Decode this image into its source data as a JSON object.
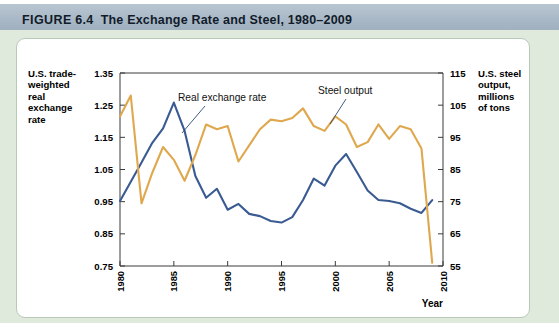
{
  "header": {
    "figure_word": "FIGURE",
    "figure_number": "6.4",
    "title": "The Exchange Rate and Steel, 1980–2009",
    "band_color": "#aab9c7"
  },
  "panel": {
    "background_color": "#dfeadd",
    "card_color": "#ffffff"
  },
  "chart_data": {
    "type": "line",
    "title": "The Exchange Rate and Steel, 1980–2009",
    "xlabel": "Year",
    "grid": false,
    "legend": "inline-annotations",
    "x": [
      1980,
      1981,
      1982,
      1983,
      1984,
      1985,
      1986,
      1987,
      1988,
      1989,
      1990,
      1991,
      1992,
      1993,
      1994,
      1995,
      1996,
      1997,
      1998,
      1999,
      2000,
      2001,
      2002,
      2003,
      2004,
      2005,
      2006,
      2007,
      2008,
      2009
    ],
    "xlim": [
      1980,
      2010
    ],
    "xticks": [
      "1980",
      "1985",
      "1990",
      "1995",
      "2000",
      "2005",
      "2010"
    ],
    "xtick_values": [
      1980,
      1985,
      1990,
      1995,
      2000,
      2005,
      2010
    ],
    "axes": [
      {
        "id": "left",
        "label": "U.S. trade-weighted real exchange rate",
        "label_lines": [
          "U.S. trade-",
          "weighted",
          "real",
          "exchange",
          "rate"
        ],
        "ylim": [
          0.75,
          1.35
        ],
        "yticks": [
          "1.35",
          "1.25",
          "1.15",
          "1.05",
          "0.95",
          "0.85",
          "0.75"
        ],
        "ytick_values": [
          1.35,
          1.25,
          1.15,
          1.05,
          0.95,
          0.85,
          0.75
        ]
      },
      {
        "id": "right",
        "label": "U.S. steel output, millions of tons",
        "label_lines": [
          "U.S. steel",
          "output,",
          "millions",
          "of tons"
        ],
        "ylim": [
          55,
          115
        ],
        "yticks": [
          "115",
          "105",
          "95",
          "85",
          "75",
          "65",
          "55"
        ],
        "ytick_values": [
          115,
          105,
          95,
          85,
          75,
          65,
          55
        ]
      }
    ],
    "series": [
      {
        "name": "Real exchange rate",
        "axis": "left",
        "color": "#3a5b92",
        "annotation": "Real exchange rate",
        "values": [
          0.952,
          1.012,
          1.072,
          1.133,
          1.178,
          1.258,
          1.17,
          1.03,
          0.962,
          0.99,
          0.925,
          0.943,
          0.912,
          0.905,
          0.89,
          0.885,
          0.902,
          0.955,
          1.022,
          1.0,
          1.062,
          1.098,
          1.042,
          0.985,
          0.955,
          0.952,
          0.945,
          0.928,
          0.915,
          0.955
        ]
      },
      {
        "name": "Steel output",
        "axis": "right",
        "color": "#dfa84e",
        "annotation": "Steel output",
        "values": [
          101.5,
          108.0,
          74.5,
          84.0,
          92.0,
          88.0,
          81.5,
          89.5,
          99.0,
          97.5,
          98.5,
          87.5,
          92.5,
          97.5,
          100.5,
          100.0,
          101.0,
          104.0,
          98.5,
          97.0,
          101.5,
          99.0,
          92.0,
          93.5,
          99.0,
          94.5,
          98.5,
          97.5,
          91.5,
          56.0
        ]
      }
    ]
  }
}
